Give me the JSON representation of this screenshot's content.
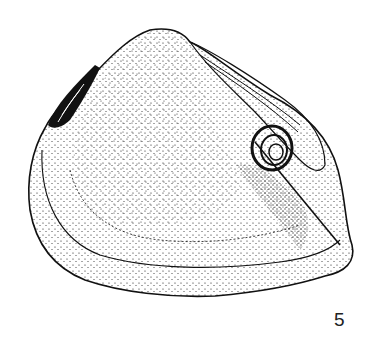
{
  "figure": {
    "style": "stippled ink drawing",
    "number": "5",
    "colors": {
      "ink": "#111111",
      "background": "#ffffff"
    }
  }
}
